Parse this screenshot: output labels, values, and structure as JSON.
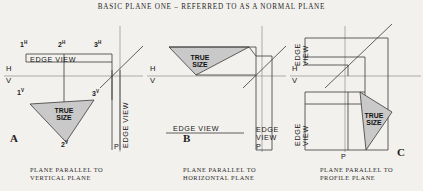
{
  "sheet": {
    "title": "BASIC PLANE ONE – REFERRED TO AS A NORMAL PLANE",
    "background_color": "#f3f1ed",
    "line_color": "#3a3a3a",
    "fill_color": "#c9c9c9"
  },
  "panels": [
    {
      "letter": "A",
      "caption_line1": "PLANE PARALLEL TO",
      "caption_line2": "VERTICAL PLANE",
      "edge_view_top": "EDGE VIEW",
      "edge_view_right": "EDGE VIEW",
      "true_size_line1": "TRUE",
      "true_size_line2": "SIZE",
      "axis_h": "H",
      "axis_v": "V",
      "profile_mark": "P",
      "points": [
        {
          "label": "1",
          "sup": "H"
        },
        {
          "label": "2",
          "sup": "H"
        },
        {
          "label": "3",
          "sup": "H"
        },
        {
          "label": "1",
          "sup": "V"
        },
        {
          "label": "2",
          "sup": "V"
        },
        {
          "label": "3",
          "sup": "V"
        }
      ]
    },
    {
      "letter": "B",
      "caption_line1": "PLANE PARALLEL TO",
      "caption_line2": "HORIZONTAL PLANE",
      "edge_view_bottom": "EDGE VIEW",
      "edge_view_right_line1": "EDGE",
      "edge_view_right_line2": "VIEW",
      "true_size_line1": "TRUE",
      "true_size_line2": "SIZE",
      "axis_h": "H",
      "axis_v": "V",
      "profile_mark": "P"
    },
    {
      "letter": "C",
      "caption_line1": "PLANE PARALLEL TO",
      "caption_line2": "PROFILE PLANE",
      "edge_view_upper_line1": "EDGE",
      "edge_view_upper_line2": "VIEW",
      "edge_view_lower_line1": "EDGE",
      "edge_view_lower_line2": "VIEW",
      "true_size_line1": "TRUE",
      "true_size_line2": "SIZE",
      "axis_h": "H",
      "axis_v": "V",
      "profile_mark": "P"
    }
  ]
}
